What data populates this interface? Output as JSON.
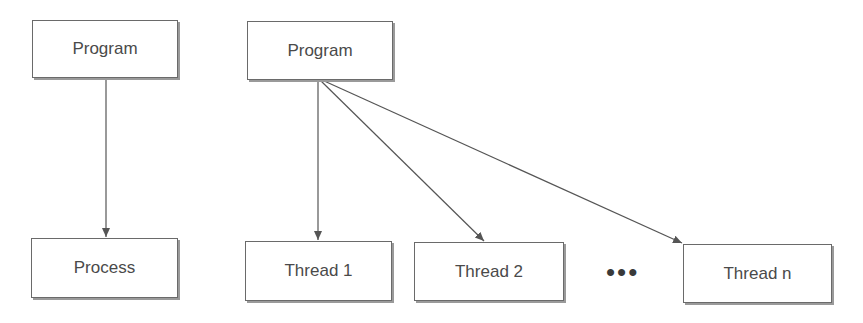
{
  "diagram": {
    "left": {
      "source": {
        "label": "Program"
      },
      "target": {
        "label": "Process"
      }
    },
    "right": {
      "source": {
        "label": "Program"
      },
      "threads": [
        {
          "label": "Thread 1"
        },
        {
          "label": "Thread 2"
        },
        {
          "label": "Thread n"
        }
      ],
      "ellipsis": "•••"
    },
    "colors": {
      "stroke": "#555555",
      "text": "#4a4a4a",
      "shadow": "#9a9a9a"
    }
  }
}
